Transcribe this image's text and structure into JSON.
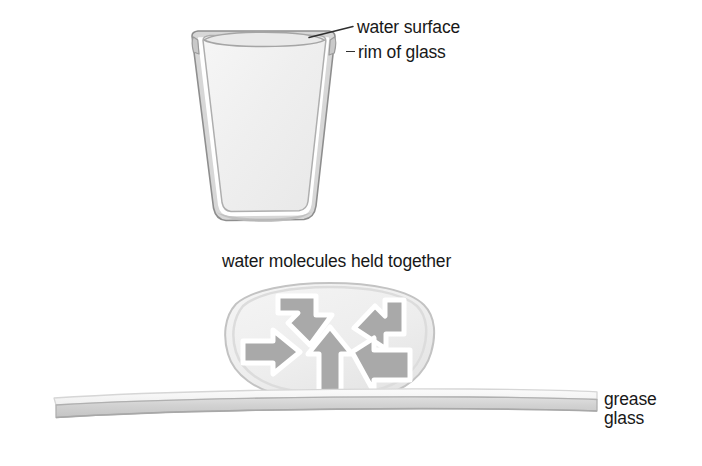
{
  "figure": {
    "background_color": "#ffffff"
  },
  "panels": {
    "glass_panel": {
      "name": "glass-of-water",
      "labels": {
        "water_surface": "water surface",
        "rim_of_glass": "rim of glass"
      },
      "colors": {
        "outline": "#9b9b9b",
        "water_fill": "#f1f1f1",
        "glass_wall": "#d9d9d9",
        "leader_line": "#2e2e2e"
      },
      "geometry": {
        "top_y": 32,
        "bottom_y": 219,
        "top_left_x": 196,
        "top_right_x": 331,
        "bottom_left_x": 219,
        "bottom_right_x": 308
      }
    },
    "droplet_panel": {
      "name": "water-droplet-cohesion",
      "label": "water molecules held together",
      "colors": {
        "droplet_fill": "#eeeeee",
        "droplet_edge": "#c9c9c9",
        "arrow_fill": "#a9a9a9",
        "arrow_outline": "#ffffff"
      },
      "arrow_count": 5,
      "arrow_directions": [
        "down-right",
        "down-left",
        "right",
        "up",
        "left"
      ],
      "geometry": {
        "center_x": 330,
        "center_y": 341,
        "radius_x": 104,
        "radius_y": 58
      }
    },
    "substrate_panel": {
      "name": "greased-glass-slab",
      "labels": {
        "grease": "grease",
        "glass": "glass"
      },
      "colors": {
        "grease_fill": "#f6f6f6",
        "grease_edge": "#d8d8d8",
        "glass_fill": "#d2d2d2",
        "glass_edge": "#b4b4b4"
      },
      "geometry": {
        "left_x": 52,
        "right_x": 598,
        "grease_top_y": 392,
        "grease_bottom_y": 405,
        "glass_top_y": 405,
        "glass_bottom_y": 419
      }
    }
  }
}
